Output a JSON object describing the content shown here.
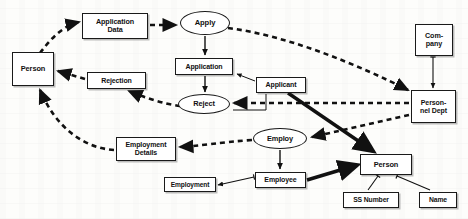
{
  "diagram": {
    "type": "data-flow-entity-relationship",
    "colors": {
      "stroke": "#1a1a1a",
      "fill": "#ffffff",
      "background": "#fdfdfb"
    },
    "nodes": [
      {
        "id": "application-data",
        "label": "Application\nData",
        "shape": "box",
        "x": 82,
        "y": 13,
        "w": 66,
        "h": 26,
        "font": 7.2
      },
      {
        "id": "apply",
        "label": "Apply",
        "shape": "ellipse",
        "x": 180,
        "y": 11,
        "w": 50,
        "h": 24,
        "font": 7.6
      },
      {
        "id": "company",
        "label": "Com-\npany",
        "shape": "box",
        "x": 415,
        "y": 24,
        "w": 38,
        "h": 32,
        "font": 7.2
      },
      {
        "id": "person-left",
        "label": "Person",
        "shape": "box",
        "x": 12,
        "y": 52,
        "w": 42,
        "h": 34,
        "font": 7.4
      },
      {
        "id": "application",
        "label": "Application",
        "shape": "box",
        "x": 175,
        "y": 58,
        "w": 58,
        "h": 17,
        "font": 7.0
      },
      {
        "id": "applicant",
        "label": "Applicant",
        "shape": "box",
        "x": 256,
        "y": 77,
        "w": 50,
        "h": 16,
        "font": 7.0
      },
      {
        "id": "rejection",
        "label": "Rejection",
        "shape": "box",
        "x": 87,
        "y": 72,
        "w": 59,
        "h": 17,
        "font": 7.0
      },
      {
        "id": "personnel-dept",
        "label": "Person-\nnel Dept",
        "shape": "box",
        "x": 411,
        "y": 90,
        "w": 45,
        "h": 33,
        "font": 7.0
      },
      {
        "id": "reject",
        "label": "Reject",
        "shape": "ellipse",
        "x": 178,
        "y": 94,
        "w": 52,
        "h": 20,
        "font": 7.4
      },
      {
        "id": "employ",
        "label": "Employ",
        "shape": "ellipse",
        "x": 253,
        "y": 128,
        "w": 54,
        "h": 21,
        "font": 7.4
      },
      {
        "id": "employment-details",
        "label": "Employment\nDetails",
        "shape": "box",
        "x": 116,
        "y": 137,
        "w": 60,
        "h": 24,
        "font": 7.0
      },
      {
        "id": "person-right",
        "label": "Person",
        "shape": "box",
        "x": 360,
        "y": 154,
        "w": 52,
        "h": 21,
        "font": 7.4
      },
      {
        "id": "employment",
        "label": "Employment",
        "shape": "box",
        "x": 164,
        "y": 177,
        "w": 52,
        "h": 15,
        "font": 6.6
      },
      {
        "id": "employee",
        "label": "Employee",
        "shape": "box",
        "x": 255,
        "y": 172,
        "w": 51,
        "h": 16,
        "font": 7.0
      },
      {
        "id": "ss-number",
        "label": "SS Number",
        "shape": "box",
        "x": 343,
        "y": 192,
        "w": 56,
        "h": 16,
        "font": 6.8
      },
      {
        "id": "name",
        "label": "Name",
        "shape": "box",
        "x": 419,
        "y": 192,
        "w": 38,
        "h": 16,
        "font": 6.8
      }
    ],
    "edges": [
      {
        "id": "person-to-application-data",
        "from": "person-left",
        "to": "application-data",
        "style": "dashed"
      },
      {
        "id": "application-data-to-apply",
        "from": "application-data",
        "to": "apply",
        "style": "dashed"
      },
      {
        "id": "apply-to-application",
        "from": "apply",
        "to": "application",
        "style": "solid-thin"
      },
      {
        "id": "apply-to-personnel-dept",
        "from": "apply",
        "to": "personnel-dept",
        "style": "dashed"
      },
      {
        "id": "application-to-reject",
        "from": "application",
        "to": "reject",
        "style": "solid-thin"
      },
      {
        "id": "applicant-to-application",
        "from": "applicant",
        "to": "application",
        "style": "solid-thin"
      },
      {
        "id": "applicant-to-reject",
        "from": "applicant",
        "to": "reject",
        "style": "solid-thin"
      },
      {
        "id": "applicant-to-person-right",
        "from": "applicant",
        "to": "person-right",
        "style": "solid-thick"
      },
      {
        "id": "company-to-personnel-dept",
        "from": "company",
        "to": "personnel-dept",
        "style": "solid-thin"
      },
      {
        "id": "personnel-dept-to-reject",
        "from": "personnel-dept",
        "to": "reject",
        "style": "dashed"
      },
      {
        "id": "personnel-dept-to-employ",
        "from": "personnel-dept",
        "to": "employ",
        "style": "dashed"
      },
      {
        "id": "reject-to-rejection",
        "from": "reject",
        "to": "rejection",
        "style": "dashed"
      },
      {
        "id": "rejection-to-person",
        "from": "rejection",
        "to": "person-left",
        "style": "dashed"
      },
      {
        "id": "reject-to-employment-details",
        "from": "reject",
        "to": "employment-details",
        "style": "dashed"
      },
      {
        "id": "employment-details-to-person",
        "from": "employment-details",
        "to": "person-left",
        "style": "dashed"
      },
      {
        "id": "employ-to-employee",
        "from": "employ",
        "to": "employee",
        "style": "solid-thin"
      },
      {
        "id": "employment-to-employee",
        "from": "employee",
        "to": "employment",
        "style": "solid-thin"
      },
      {
        "id": "employee-to-person-right",
        "from": "employee",
        "to": "person-right",
        "style": "solid-thick"
      },
      {
        "id": "person-right-to-ss-number",
        "from": "person-right",
        "to": "ss-number",
        "style": "solid-thin"
      },
      {
        "id": "person-right-to-name",
        "from": "person-right",
        "to": "name",
        "style": "solid-thin"
      }
    ]
  }
}
